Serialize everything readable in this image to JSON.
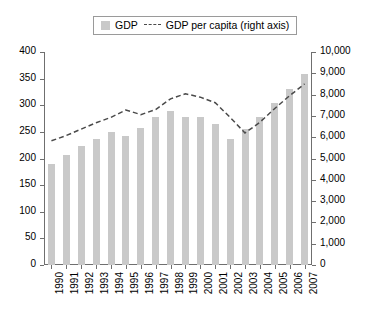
{
  "legend": {
    "bar_label": "GDP",
    "line_label": "GDP per capita (right axis)",
    "bar_color": "#c9c9c9",
    "line_color": "#4a4a4a"
  },
  "chart_data": {
    "type": "bar",
    "title": "",
    "xlabel": "",
    "ylabel": "",
    "grid": false,
    "legend_position": "top-center",
    "categories": [
      "1990",
      "1991",
      "1992",
      "1993",
      "1994",
      "1995",
      "1996",
      "1997",
      "1998",
      "1999",
      "2000",
      "2001",
      "2002",
      "2003",
      "2004",
      "2005",
      "2006",
      "2007"
    ],
    "left_axis": {
      "label": "",
      "ylim": [
        0,
        400
      ],
      "tick_step": 50,
      "ticks": [
        "0",
        "50",
        "100",
        "150",
        "200",
        "250",
        "300",
        "350",
        "400"
      ]
    },
    "right_axis": {
      "label": "",
      "ylim": [
        0,
        10000
      ],
      "tick_step": 1000,
      "ticks": [
        "0",
        "1,000",
        "2,000",
        "3,000",
        "4,000",
        "5,000",
        "6,000",
        "7,000",
        "8,000",
        "9,000",
        "10,000"
      ]
    },
    "series": [
      {
        "name": "GDP",
        "type": "bar",
        "axis": "left",
        "color": "#c9c9c9",
        "values": [
          189,
          207,
          224,
          237,
          250,
          243,
          257,
          278,
          289,
          278,
          277,
          264,
          236,
          255,
          278,
          304,
          330,
          358
        ]
      },
      {
        "name": "GDP per capita (right axis)",
        "type": "line",
        "axis": "right",
        "style": "dashed",
        "color": "#4a4a4a",
        "values": [
          5830,
          6080,
          6380,
          6680,
          6930,
          7280,
          7060,
          7300,
          7800,
          8040,
          7880,
          7620,
          6930,
          6200,
          6700,
          7350,
          7950,
          8500
        ]
      }
    ]
  }
}
